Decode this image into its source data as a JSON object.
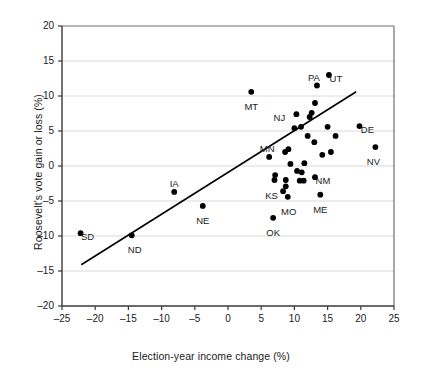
{
  "chart_data": {
    "type": "scatter",
    "title": "",
    "xlabel": "Election-year income change (%)",
    "ylabel": "Roosevelt's vote gain or loss (%)",
    "xlim": [
      -25,
      25
    ],
    "ylim": [
      -20,
      20
    ],
    "xticks": [
      -25,
      -20,
      -15,
      -10,
      -5,
      0,
      5,
      10,
      15,
      20,
      25
    ],
    "xticklabels": [
      "–25",
      "–20",
      "–15",
      "–10",
      "–5",
      "0",
      "5",
      "10",
      "15",
      "20",
      "25"
    ],
    "yticks": [
      -20,
      -15,
      -10,
      -5,
      0,
      5,
      10,
      15,
      20
    ],
    "yticklabels": [
      "–20",
      "–15",
      "–10",
      "–5",
      "0",
      "5",
      "10",
      "15",
      "20"
    ],
    "grid": "horizontal",
    "legend": "none",
    "marker_color": "#000000",
    "line_color": "#000000",
    "grid_color": "#d9d9d9",
    "axis_color": "#6f6f6f",
    "trendline": {
      "label": "regression line",
      "x_start": -22.1,
      "y_start": -14.1,
      "x_end": 19.3,
      "y_end": 10.6
    },
    "points": [
      {
        "label": "SD",
        "x": -22.2,
        "y": -9.6,
        "label_dx": 7,
        "label_dy": 4
      },
      {
        "label": "ND",
        "x": -14.5,
        "y": -9.9,
        "label_dx": 3,
        "label_dy": 15
      },
      {
        "label": "IA",
        "x": -8.1,
        "y": -3.7,
        "label_dx": 0,
        "label_dy": -8
      },
      {
        "label": "NE",
        "x": -3.8,
        "y": -5.7,
        "label_dx": 0,
        "label_dy": 15
      },
      {
        "label": "MT",
        "x": 3.5,
        "y": 10.6,
        "label_dx": 0,
        "label_dy": 15
      },
      {
        "label": "MN",
        "x": 6.2,
        "y": 1.3,
        "label_dx": -2,
        "label_dy": -8
      },
      {
        "label": "KS",
        "x": 7.0,
        "y": -2.0,
        "label_dx": -3,
        "label_dy": 16
      },
      {
        "label": "OK",
        "x": 6.8,
        "y": -7.4,
        "label_dx": 0,
        "label_dy": 15
      },
      {
        "label": "MO",
        "x": 9.0,
        "y": -4.4,
        "label_dx": 1,
        "label_dy": 15
      },
      {
        "label": "NJ",
        "x": 10.3,
        "y": 7.4,
        "label_dx": -17,
        "label_dy": 4
      },
      {
        "label": "PA",
        "x": 13.4,
        "y": 11.5,
        "label_dx": -3,
        "label_dy": -8
      },
      {
        "label": "UT",
        "x": 15.2,
        "y": 13.0,
        "label_dx": 7,
        "label_dy": 4
      },
      {
        "label": "ME",
        "x": 13.9,
        "y": -4.1,
        "label_dx": 0,
        "label_dy": 15
      },
      {
        "label": "NM",
        "x": 13.1,
        "y": -1.6,
        "label_dx": 8,
        "label_dy": 4
      },
      {
        "label": "DE",
        "x": 19.8,
        "y": 5.7,
        "label_dx": 8,
        "label_dy": 4
      },
      {
        "label": "NV",
        "x": 22.2,
        "y": 2.7,
        "label_dx": -2,
        "label_dy": 15
      },
      {
        "label": "",
        "x": 8.6,
        "y": 2.0,
        "label_dx": 0,
        "label_dy": 0
      },
      {
        "label": "",
        "x": 9.1,
        "y": 2.4,
        "label_dx": 0,
        "label_dy": 0
      },
      {
        "label": "",
        "x": 9.4,
        "y": 0.3,
        "label_dx": 0,
        "label_dy": 0
      },
      {
        "label": "",
        "x": 8.7,
        "y": -2.0,
        "label_dx": 0,
        "label_dy": 0
      },
      {
        "label": "",
        "x": 8.7,
        "y": -2.9,
        "label_dx": 0,
        "label_dy": 0
      },
      {
        "label": "",
        "x": 8.3,
        "y": -3.6,
        "label_dx": 0,
        "label_dy": 0
      },
      {
        "label": "",
        "x": 7.1,
        "y": -1.3,
        "label_dx": 0,
        "label_dy": 0
      },
      {
        "label": "",
        "x": 10.4,
        "y": -0.7,
        "label_dx": 0,
        "label_dy": 0
      },
      {
        "label": "",
        "x": 11.1,
        "y": -0.9,
        "label_dx": 0,
        "label_dy": 0
      },
      {
        "label": "",
        "x": 10.8,
        "y": -2.1,
        "label_dx": 0,
        "label_dy": 0
      },
      {
        "label": "",
        "x": 11.4,
        "y": -2.1,
        "label_dx": 0,
        "label_dy": 0
      },
      {
        "label": "",
        "x": 10.0,
        "y": 5.4,
        "label_dx": 0,
        "label_dy": 0
      },
      {
        "label": "",
        "x": 11.0,
        "y": 5.6,
        "label_dx": 0,
        "label_dy": 0
      },
      {
        "label": "",
        "x": 12.3,
        "y": 7.0,
        "label_dx": 0,
        "label_dy": 0
      },
      {
        "label": "",
        "x": 12.6,
        "y": 7.6,
        "label_dx": 0,
        "label_dy": 0
      },
      {
        "label": "",
        "x": 12.0,
        "y": 4.3,
        "label_dx": 0,
        "label_dy": 0
      },
      {
        "label": "",
        "x": 13.0,
        "y": 3.4,
        "label_dx": 0,
        "label_dy": 0
      },
      {
        "label": "",
        "x": 15.0,
        "y": 5.6,
        "label_dx": 0,
        "label_dy": 0
      },
      {
        "label": "",
        "x": 16.2,
        "y": 4.3,
        "label_dx": 0,
        "label_dy": 0
      },
      {
        "label": "",
        "x": 14.2,
        "y": 1.6,
        "label_dx": 0,
        "label_dy": 0
      },
      {
        "label": "",
        "x": 15.5,
        "y": 2.0,
        "label_dx": 0,
        "label_dy": 0
      },
      {
        "label": "",
        "x": 11.5,
        "y": 0.4,
        "label_dx": 0,
        "label_dy": 0
      },
      {
        "label": "",
        "x": 13.1,
        "y": 9.0,
        "label_dx": 0,
        "label_dy": 0
      }
    ]
  }
}
